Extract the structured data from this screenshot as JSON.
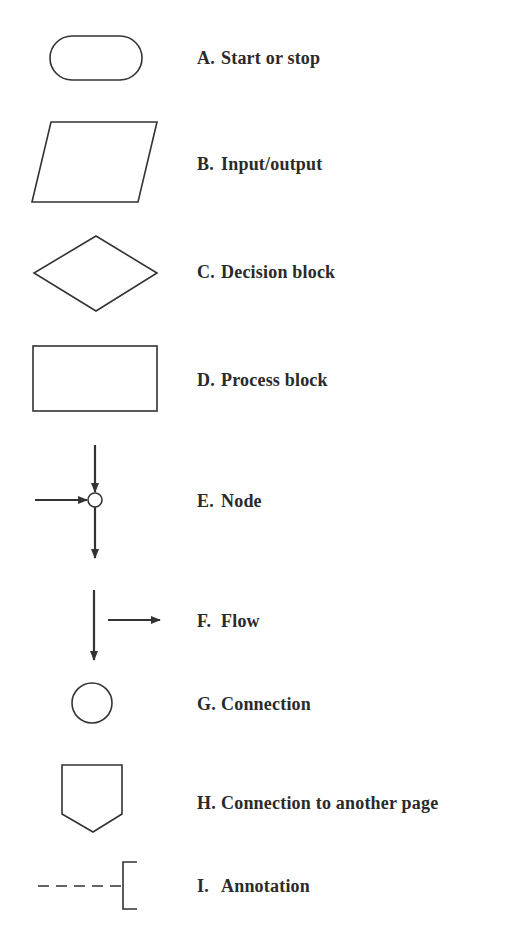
{
  "legend": {
    "items": [
      {
        "letter": "A.",
        "label": "Start or stop",
        "symbol": "terminal-rounded-rectangle"
      },
      {
        "letter": "B.",
        "label": "Input/output",
        "symbol": "parallelogram"
      },
      {
        "letter": "C.",
        "label": "Decision block",
        "symbol": "diamond"
      },
      {
        "letter": "D.",
        "label": "Process block",
        "symbol": "rectangle"
      },
      {
        "letter": "E.",
        "label": "Node",
        "symbol": "node-circle-with-arrows"
      },
      {
        "letter": "F.",
        "label": "Flow",
        "symbol": "flow-arrows"
      },
      {
        "letter": "G.",
        "label": "Connection",
        "symbol": "circle"
      },
      {
        "letter": "H.",
        "label": "Connection to another page",
        "symbol": "off-page-pentagon"
      },
      {
        "letter": "I.",
        "label": "Annotation",
        "symbol": "dashed-line-with-bracket"
      }
    ]
  },
  "colors": {
    "stroke": "#333333",
    "background": "#ffffff"
  }
}
